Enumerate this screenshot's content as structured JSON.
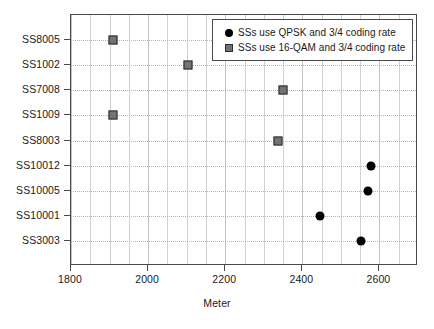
{
  "chart_data": {
    "type": "scatter",
    "title": "",
    "xlabel": "Meter",
    "ylabel": "",
    "xlim": [
      1800,
      2700
    ],
    "xticks": [
      1800,
      2000,
      2200,
      2400,
      2600
    ],
    "xtick_labels": [
      "1800",
      "2000",
      "2200",
      "2400",
      "2600"
    ],
    "minor_gridline_step": 50,
    "grid": true,
    "legend_position": "top-right",
    "categories": [
      "SS8005",
      "SS1002",
      "SS7008",
      "SS1009",
      "SS8003",
      "SS10012",
      "SS10005",
      "SS10001",
      "SS3003"
    ],
    "series": [
      {
        "name": "SSs use QPSK and 3/4 coding rate",
        "marker": "circle",
        "color": "#000000",
        "points": [
          {
            "category": "SS10012",
            "value": 2578
          },
          {
            "category": "SS10005",
            "value": 2570
          },
          {
            "category": "SS10001",
            "value": 2447
          },
          {
            "category": "SS3003",
            "value": 2552
          }
        ]
      },
      {
        "name": "SSs use 16-QAM and 3/4 coding rate",
        "marker": "square",
        "color": "#737373",
        "points": [
          {
            "category": "SS8005",
            "value": 1909
          },
          {
            "category": "SS1002",
            "value": 2103
          },
          {
            "category": "SS7008",
            "value": 2351
          },
          {
            "category": "SS1009",
            "value": 1909
          },
          {
            "category": "SS8003",
            "value": 2338
          }
        ]
      }
    ]
  },
  "legend": {
    "items": [
      {
        "label": "SSs use QPSK and 3/4 coding rate",
        "marker": "circle"
      },
      {
        "label": "SSs use 16-QAM and 3/4 coding rate",
        "marker": "square"
      }
    ]
  }
}
